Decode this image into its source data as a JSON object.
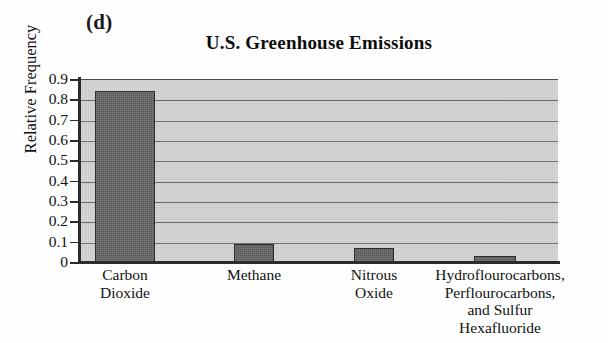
{
  "figure": {
    "panel_letter": "(d)",
    "title": "U.S. Greenhouse Emissions"
  },
  "axes": {
    "y_title": "Relative Frequency",
    "y_ticks": [
      "0.9",
      "0.8",
      "0.7",
      "0.6",
      "0.5",
      "0.4",
      "0.3",
      "0.2",
      "0.1",
      "0"
    ]
  },
  "categories": [
    {
      "line1": "Carbon",
      "line2": "Dioxide",
      "line3": "",
      "line4": ""
    },
    {
      "line1": "Methane",
      "line2": "",
      "line3": "",
      "line4": ""
    },
    {
      "line1": "Nitrous",
      "line2": "Oxide",
      "line3": "",
      "line4": ""
    },
    {
      "line1": "Hydroflourocarbons,",
      "line2": "Perflourocarbons,",
      "line3": "and Sulfur",
      "line4": "Hexafluoride"
    }
  ],
  "colors": {
    "bar_fill": "#585858",
    "bar_border": "#2e2e2e",
    "plot_background": "#d9d9d9",
    "gridline": "#6e6e6e",
    "axis": "#2b2b2b",
    "text": "#111111"
  },
  "chart_data": {
    "type": "bar",
    "title": "U.S. Greenhouse Emissions",
    "xlabel": "",
    "ylabel": "Relative Frequency",
    "categories": [
      "Carbon Dioxide",
      "Methane",
      "Nitrous Oxide",
      "Hydroflourocarbons, Perflourocarbons, and Sulfur Hexafluoride"
    ],
    "values": [
      0.84,
      0.09,
      0.07,
      0.03
    ],
    "ylim": [
      0,
      0.9
    ],
    "ytick_step": 0.1,
    "yticks": [
      0,
      0.1,
      0.2,
      0.3,
      0.4,
      0.5,
      0.6,
      0.7,
      0.8,
      0.9
    ],
    "grid": true,
    "grid_axis": "y",
    "legend": false,
    "annotations": [
      "(d)"
    ]
  }
}
